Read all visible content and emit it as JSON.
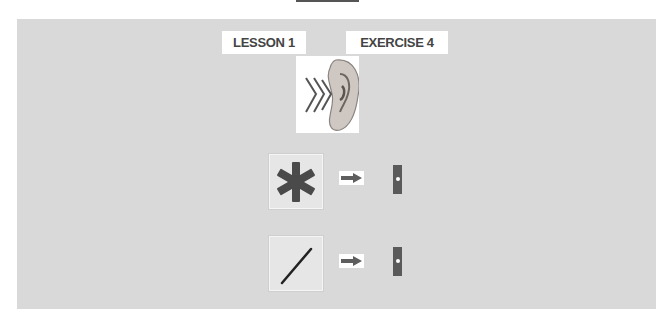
{
  "header": {
    "lesson_label": "LESSON 1",
    "exercise_label": "EXERCISE 4"
  },
  "prompt": {
    "icon": "ear-listening-icon"
  },
  "items": [
    {
      "symbol": "asterisk-icon",
      "arrow": "arrow-right-icon",
      "target": "bar-slot-icon"
    },
    {
      "symbol": "slash-icon",
      "arrow": "arrow-right-icon",
      "target": "bar-slot-icon"
    }
  ],
  "colors": {
    "panel": "#d9d9d9",
    "label_text": "#444444",
    "symbol": "#4a4a4a"
  }
}
